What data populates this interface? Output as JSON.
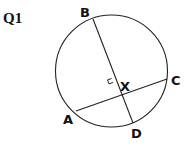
{
  "question_label": "Q1",
  "diagram": {
    "type": "circle-with-perpendicular-chords",
    "points": {
      "B": {
        "label": "B"
      },
      "C": {
        "label": "C"
      },
      "A": {
        "label": "A"
      },
      "D": {
        "label": "D"
      },
      "X": {
        "label": "X"
      }
    },
    "chords": [
      "BD",
      "AC"
    ],
    "right_angle_at": "X",
    "line_color": "#222222"
  }
}
